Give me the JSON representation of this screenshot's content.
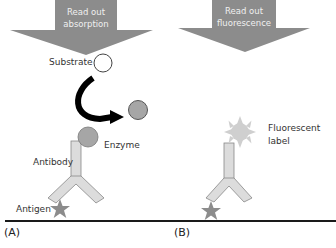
{
  "panels": {
    "A": {
      "label": "(A)",
      "readout": [
        "Read out",
        "absorption"
      ],
      "substrate_label": "Substrate",
      "enzyme_label": "Enzyme",
      "antibody_label": "Antibody",
      "antigen_label": "Antigen"
    },
    "B": {
      "label": "(B)",
      "readout": [
        "Read out",
        "fluorescence"
      ],
      "fluorescent_label": [
        "Fluorescent",
        "label"
      ]
    }
  },
  "colors": {
    "arrow_fill": "#8c8c8c",
    "antibody_fill": "#dcdcdc",
    "enzyme_fill": "#a6a6a6",
    "product_fill": "#a6a6a6",
    "antigen_fill": "#8c8c8c",
    "fluor_fill": "#cfcfcf",
    "baseline": "#1a1a1a"
  }
}
